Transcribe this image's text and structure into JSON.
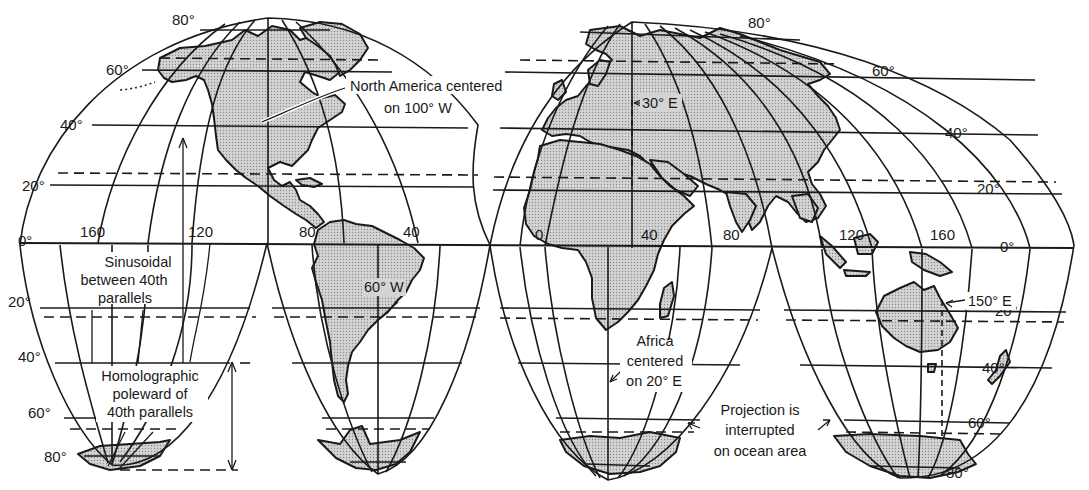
{
  "figure": {
    "colors": {
      "land": "#c8c8c8",
      "line": "#1a1a1a",
      "background": "#ffffff"
    }
  },
  "latitude_labels": {
    "left": [
      "80°",
      "60°",
      "40°",
      "20°",
      "0°",
      "20°",
      "40°",
      "60°",
      "80°"
    ],
    "right": [
      "80°",
      "60°",
      "40°",
      "20°",
      "0°",
      "20°",
      "40°",
      "60°",
      "80°"
    ]
  },
  "longitude_labels": [
    "160",
    "120",
    "80",
    "40",
    "0",
    "40",
    "80",
    "120",
    "160"
  ],
  "annotations": {
    "north_america": [
      "North America centered",
      "on 100° W"
    ],
    "europe_meridian": "30° E",
    "south_america_meridian": "60° W",
    "sinusoidal": [
      "Sinusoidal",
      "between 40th",
      "parallels"
    ],
    "homolographic": [
      "Homolographic",
      "poleward of",
      "40th parallels"
    ],
    "africa": [
      "Africa",
      "centered",
      "on 20° E"
    ],
    "interrupted": [
      "Projection is",
      "interrupted",
      "on ocean area"
    ],
    "australia_meridian": "150° E"
  }
}
